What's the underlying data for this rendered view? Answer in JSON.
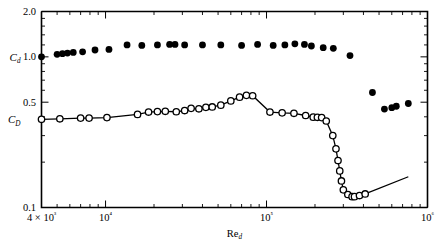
{
  "chart_data": {
    "type": "scatter",
    "title": "",
    "xlabel": "Re_d",
    "xlabel_base": "Re",
    "xlabel_sub": "d",
    "ylabel": "",
    "xscale": "log",
    "yscale": "log",
    "xlim": [
      4000,
      1000000
    ],
    "ylim": [
      0.1,
      2.0
    ],
    "grid": false,
    "legend_position": "inline-left-axis",
    "x_tick_labels": [
      "4 × 10³",
      "10⁴",
      "10⁵",
      "10⁶"
    ],
    "x_tick_values": [
      4000,
      10000,
      100000,
      1000000
    ],
    "y_tick_labels": [
      "2.0",
      "1.0",
      "0.5",
      "0.1"
    ],
    "y_tick_values": [
      2.0,
      1.0,
      0.5,
      0.1
    ],
    "series": [
      {
        "name": "C_d",
        "label_base": "C",
        "label_sub": "d",
        "marker": "filled-circle",
        "line": false,
        "points": [
          [
            4000,
            1.0
          ],
          [
            5000,
            1.04
          ],
          [
            5400,
            1.05
          ],
          [
            5800,
            1.06
          ],
          [
            6300,
            1.07
          ],
          [
            7200,
            1.08
          ],
          [
            8600,
            1.11
          ],
          [
            10500,
            1.12
          ],
          [
            13600,
            1.2
          ],
          [
            16800,
            1.19
          ],
          [
            21000,
            1.2
          ],
          [
            25000,
            1.21
          ],
          [
            27000,
            1.21
          ],
          [
            31000,
            1.2
          ],
          [
            40000,
            1.2
          ],
          [
            52000,
            1.2
          ],
          [
            70000,
            1.19
          ],
          [
            88000,
            1.21
          ],
          [
            110000,
            1.19
          ],
          [
            130000,
            1.2
          ],
          [
            150000,
            1.22
          ],
          [
            172000,
            1.21
          ],
          [
            190000,
            1.18
          ],
          [
            225000,
            1.15
          ],
          [
            260000,
            1.14
          ],
          [
            330000,
            1.02
          ],
          [
            455000,
            0.58
          ],
          [
            540000,
            0.45
          ],
          [
            600000,
            0.46
          ],
          [
            640000,
            0.47
          ],
          [
            760000,
            0.49
          ]
        ]
      },
      {
        "name": "C_D",
        "label_base": "C",
        "label_sub": "D",
        "marker": "open-circle",
        "line": true,
        "points": [
          [
            4000,
            0.385
          ],
          [
            5200,
            0.388
          ],
          [
            7000,
            0.392
          ],
          [
            7900,
            0.392
          ],
          [
            10200,
            0.395
          ],
          [
            15800,
            0.415
          ],
          [
            18500,
            0.43
          ],
          [
            21000,
            0.433
          ],
          [
            23500,
            0.435
          ],
          [
            27500,
            0.432
          ],
          [
            31000,
            0.44
          ],
          [
            34000,
            0.455
          ],
          [
            38000,
            0.452
          ],
          [
            42000,
            0.462
          ],
          [
            46000,
            0.465
          ],
          [
            52000,
            0.478
          ],
          [
            60000,
            0.51
          ],
          [
            68000,
            0.54
          ],
          [
            75000,
            0.555
          ],
          [
            82000,
            0.552
          ],
          [
            105000,
            0.43
          ],
          [
            125000,
            0.425
          ],
          [
            148000,
            0.422
          ],
          [
            175000,
            0.408
          ],
          [
            195000,
            0.398
          ],
          [
            207000,
            0.397
          ],
          [
            220000,
            0.395
          ],
          [
            235000,
            0.375
          ],
          [
            258000,
            0.3
          ],
          [
            270000,
            0.245
          ],
          [
            278000,
            0.205
          ],
          [
            285000,
            0.175
          ],
          [
            292000,
            0.15
          ],
          [
            300000,
            0.131
          ],
          [
            320000,
            0.122
          ],
          [
            340000,
            0.118
          ],
          [
            352000,
            0.118
          ],
          [
            378000,
            0.12
          ],
          [
            410000,
            0.123
          ]
        ]
      },
      {
        "name": "tail-line",
        "marker": "none",
        "line": true,
        "points": [
          [
            410000,
            0.123
          ],
          [
            760000,
            0.16
          ]
        ]
      }
    ]
  }
}
